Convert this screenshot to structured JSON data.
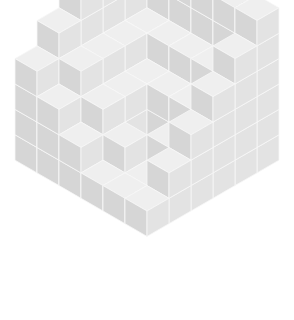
{
  "colors": {
    "background": "#ffffff",
    "top": "#efefef",
    "left": "#d6d6d6",
    "right": "#e3e3e3",
    "edge": "#f7f7f7"
  },
  "geometry": {
    "origin_x": 147,
    "origin_y": 84,
    "unit_w": 22,
    "unit_h": 12.7,
    "grid_size": 6
  },
  "heightmap": [
    [
      6,
      6,
      6,
      6,
      6,
      6
    ],
    [
      6,
      4,
      4,
      4,
      4,
      5
    ],
    [
      6,
      4,
      3,
      3,
      3,
      4
    ],
    [
      6,
      4,
      3,
      1,
      2,
      3
    ],
    [
      5,
      4,
      3,
      2,
      1,
      2
    ],
    [
      4,
      3,
      2,
      1,
      1,
      1
    ]
  ]
}
